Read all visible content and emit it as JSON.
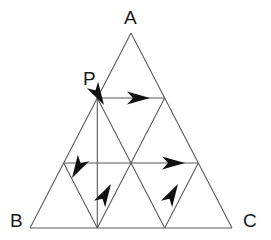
{
  "figure": {
    "type": "geometry-diagram",
    "background_color": "#ffffff",
    "line_color": "#5a5a5a",
    "arrow_color": "#111111",
    "label_color": "#1a1a1a",
    "stroke_width": 1
  },
  "labels": [
    {
      "id": "A",
      "text": "A",
      "x": 130,
      "y": 8,
      "anchor": "apex-top"
    },
    {
      "id": "B",
      "text": "B",
      "x": 8,
      "y": 212,
      "anchor": "bottom-left"
    },
    {
      "id": "C",
      "text": "C",
      "x": 243,
      "y": 212,
      "anchor": "bottom-right"
    },
    {
      "id": "P",
      "text": "P",
      "x": 84,
      "y": 70,
      "anchor": "left-side-point"
    }
  ],
  "geometry": {
    "triangle": {
      "name": "ABC",
      "apex": {
        "x": 131,
        "y": 33
      },
      "bottom_left": {
        "x": 30,
        "y": 228
      },
      "bottom_right": {
        "x": 232,
        "y": 228
      },
      "subdivisions": 3
    },
    "points": {
      "A": {
        "x": 131,
        "y": 33
      },
      "B": {
        "x": 30,
        "y": 228
      },
      "C": {
        "x": 232,
        "y": 228
      },
      "P": {
        "x": 97.3,
        "y": 98
      },
      "AB_1": {
        "x": 97.3,
        "y": 98
      },
      "AB_2": {
        "x": 63.7,
        "y": 163
      },
      "AC_1": {
        "x": 164.7,
        "y": 98
      },
      "AC_2": {
        "x": 198.3,
        "y": 163
      },
      "BC_1": {
        "x": 97.3,
        "y": 228
      },
      "BC_2": {
        "x": 164.7,
        "y": 228
      },
      "MID_L": {
        "x": 131,
        "y": 163
      },
      "MID_R": {
        "x": 131,
        "y": 163
      }
    },
    "grid_lines": [
      {
        "name": "side-AB",
        "from": "A",
        "to": "B"
      },
      {
        "name": "side-AC",
        "from": "A",
        "to": "C"
      },
      {
        "name": "side-BC",
        "from": "B",
        "to": "C"
      },
      {
        "name": "parallel-BC-1",
        "from": "AB_1",
        "to": "AC_1"
      },
      {
        "name": "parallel-BC-2",
        "from": "AB_2",
        "to": "AC_2"
      },
      {
        "name": "parallel-AC-1",
        "from": "AB_1",
        "to": "BC_1"
      },
      {
        "name": "parallel-AC-2",
        "from": "AB_2",
        "to": "BC_2"
      },
      {
        "name": "parallel-AB-1",
        "from": "AC_1",
        "to": "BC_2"
      },
      {
        "name": "parallel-AB-2",
        "from": "AC_2",
        "to": "BC_1"
      }
    ],
    "arrows": [
      {
        "id": "arrow-top-right",
        "on_segment": "parallel-BC-1",
        "direction": "right",
        "tip": {
          "x": 146,
          "y": 98
        },
        "angle_deg": 0
      },
      {
        "id": "arrow-mid-right",
        "on_segment": "parallel-BC-2",
        "direction": "right",
        "tip": {
          "x": 180,
          "y": 163
        },
        "angle_deg": 0
      },
      {
        "id": "arrow-to-P-up-left",
        "on_segment": "parallel-AB-2",
        "direction": "up-left",
        "tip": {
          "x": 104,
          "y": 105
        },
        "angle_deg": 240
      },
      {
        "id": "arrow-lower-left-up",
        "on_segment": "parallel-AC-2",
        "direction": "up-right",
        "tip": {
          "x": 73,
          "y": 180
        },
        "angle_deg": 300
      },
      {
        "id": "arrow-lower-mid-down",
        "on_segment": "parallel-AB-2",
        "direction": "down-left",
        "tip": {
          "x": 111,
          "y": 183
        },
        "angle_deg": 120
      },
      {
        "id": "arrow-lower-right-down",
        "on_segment": "parallel-AB-1",
        "direction": "down-left",
        "tip": {
          "x": 178,
          "y": 183
        },
        "angle_deg": 120
      }
    ]
  }
}
